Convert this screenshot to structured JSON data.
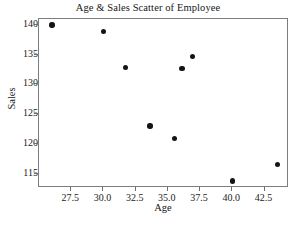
{
  "chart_data": {
    "type": "scatter",
    "title": "Age & Sales Scatter of Employee",
    "xlabel": "Age",
    "ylabel": "Sales",
    "xlim": [
      25.0,
      44.4
    ],
    "ylim": [
      112.6,
      141.0
    ],
    "grid": false,
    "legend": null,
    "marker": {
      "shape": "circle",
      "color": "#141414",
      "size": 5.4
    },
    "xticks": [
      27.5,
      30.0,
      32.5,
      35.0,
      37.5,
      40.0,
      42.5
    ],
    "xtick_labels": [
      "27.5",
      "30.0",
      "32.5",
      "35.0",
      "37.5",
      "40.0",
      "42.5"
    ],
    "yticks": [
      115,
      120,
      125,
      130,
      135,
      140
    ],
    "ytick_labels": [
      "115",
      "120",
      "125",
      "130",
      "135",
      "140"
    ],
    "points": [
      {
        "x": 26.0,
        "y": 140.0
      },
      {
        "x": 30.0,
        "y": 138.9
      },
      {
        "x": 31.7,
        "y": 132.9
      },
      {
        "x": 33.6,
        "y": 123.0
      },
      {
        "x": 35.5,
        "y": 120.9
      },
      {
        "x": 36.1,
        "y": 132.7
      },
      {
        "x": 36.9,
        "y": 134.7
      },
      {
        "x": 40.0,
        "y": 113.8
      },
      {
        "x": 43.5,
        "y": 116.6
      }
    ]
  },
  "figure": {
    "background_color": "#ffffff",
    "frame_color": "#7d7d7d"
  }
}
